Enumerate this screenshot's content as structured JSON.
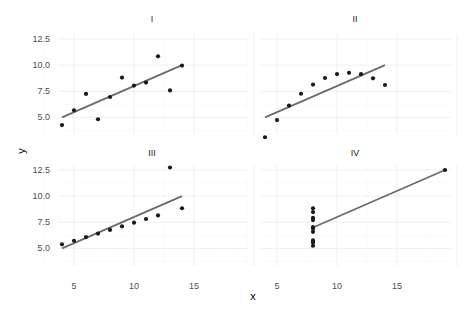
{
  "chart_data": {
    "type": "scatter",
    "title": "",
    "xlabel": "x",
    "ylabel": "y",
    "facets": [
      "I",
      "II",
      "III",
      "IV"
    ],
    "x_ticks": [
      5,
      10,
      15
    ],
    "y_ticks": [
      5.0,
      7.5,
      10.0,
      12.5
    ],
    "y_tick_labels": [
      "5.0",
      "7.5",
      "10.0",
      "12.5"
    ],
    "x_tick_labels": [
      "5",
      "10",
      "15"
    ],
    "grid": true,
    "shared_axes": true,
    "fit_line": {
      "type": "linear",
      "color": "#6b6b6b"
    },
    "point_color": "#1a1a1a",
    "series": [
      {
        "name": "I",
        "x": [
          10,
          8,
          13,
          9,
          11,
          14,
          6,
          4,
          12,
          7,
          5
        ],
        "y": [
          8.04,
          6.95,
          7.58,
          8.81,
          8.33,
          9.96,
          7.24,
          4.26,
          10.84,
          4.82,
          5.68
        ]
      },
      {
        "name": "II",
        "x": [
          10,
          8,
          13,
          9,
          11,
          14,
          6,
          4,
          12,
          7,
          5
        ],
        "y": [
          9.14,
          8.14,
          8.74,
          8.77,
          9.26,
          8.1,
          6.13,
          3.1,
          9.13,
          7.26,
          4.74
        ]
      },
      {
        "name": "III",
        "x": [
          10,
          8,
          13,
          9,
          11,
          14,
          6,
          4,
          12,
          7,
          5
        ],
        "y": [
          7.46,
          6.77,
          12.74,
          7.11,
          7.81,
          8.84,
          6.08,
          5.39,
          8.15,
          6.42,
          5.73
        ]
      },
      {
        "name": "IV",
        "x": [
          8,
          8,
          8,
          8,
          8,
          8,
          8,
          19,
          8,
          8,
          8
        ],
        "y": [
          6.58,
          5.76,
          7.71,
          8.84,
          8.47,
          7.04,
          5.25,
          12.5,
          5.56,
          7.91,
          6.89
        ]
      }
    ]
  }
}
